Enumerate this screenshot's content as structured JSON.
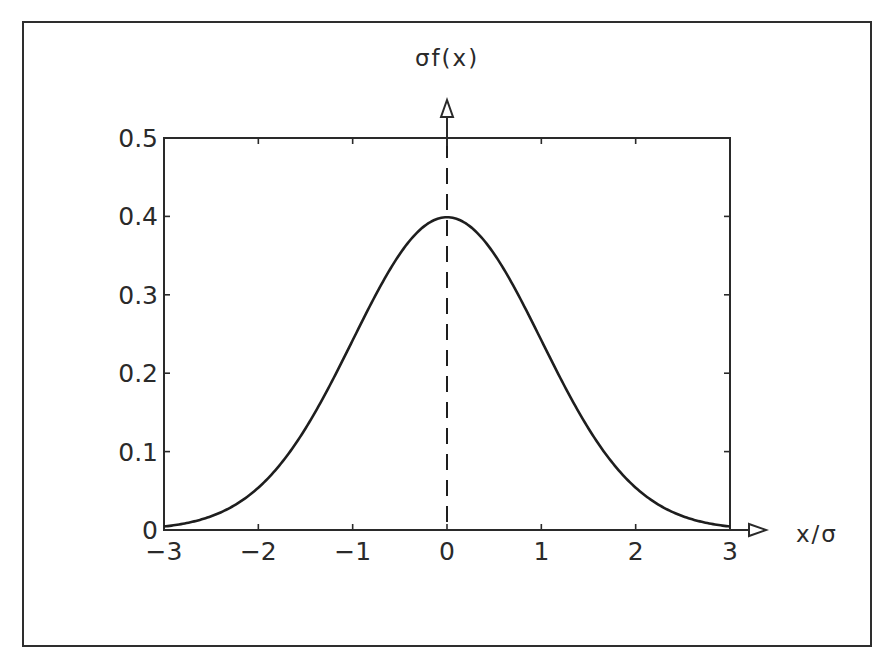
{
  "chart_data": {
    "type": "line",
    "title": "",
    "xlabel": "x/σ",
    "ylabel": "σf(x)",
    "xlim": [
      -3,
      3
    ],
    "ylim": [
      0,
      0.5
    ],
    "grid": false,
    "legend": null,
    "x_ticks": [
      "−3",
      "−2",
      "−1",
      "0",
      "1",
      "2",
      "3"
    ],
    "x_tick_values": [
      -3,
      -2,
      -1,
      0,
      1,
      2,
      3
    ],
    "y_ticks": [
      "0",
      "0.1",
      "0.2",
      "0.3",
      "0.4",
      "0.5"
    ],
    "y_tick_values": [
      0,
      0.1,
      0.2,
      0.3,
      0.4,
      0.5
    ],
    "series": [
      {
        "name": "standard normal density",
        "x": [
          -3,
          -2.5,
          -2,
          -1.5,
          -1,
          -0.5,
          0,
          0.5,
          1,
          1.5,
          2,
          2.5,
          3
        ],
        "values": [
          0.0044,
          0.0175,
          0.054,
          0.1295,
          0.242,
          0.3521,
          0.3989,
          0.3521,
          0.242,
          0.1295,
          0.054,
          0.0175,
          0.0044
        ]
      }
    ],
    "annotations": [
      {
        "type": "vertical-dashed-line",
        "x": 0
      },
      {
        "type": "y-axis-arrow",
        "x": 0
      },
      {
        "type": "x-axis-arrow",
        "y": 0
      }
    ],
    "colors": {
      "line": "#1e1e1e",
      "axes": "#2a2a2a",
      "background": "#ffffff"
    }
  }
}
